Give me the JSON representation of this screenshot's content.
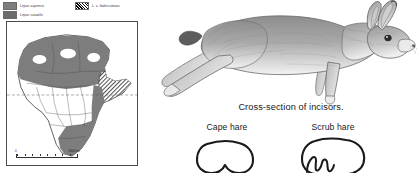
{
  "figure": {
    "kind": "natural-history-plate",
    "background": "#ffffff"
  },
  "map": {
    "region": "Africa",
    "legend": [
      {
        "label": "Lepus capensis",
        "swatch": "solid-gray",
        "color": "#7d7d7d",
        "icon": "legend-swatch-icon"
      },
      {
        "label": "Lepus saxatilis",
        "swatch": "solid-gray",
        "color": "#6b6b6b",
        "icon": "legend-swatch-icon"
      },
      {
        "label": "L. c. habessinicus",
        "swatch": "hatched",
        "color": "#2b2b2b",
        "icon": "legend-swatch-hatched-icon"
      }
    ],
    "scalebar": {
      "zero": "0",
      "length_label": "2000 km"
    },
    "features": {
      "equator_line": true,
      "frame_border": true,
      "gray_range_north": "Sahara / North Africa",
      "gray_range_south": "Southern Africa",
      "hatched_range": "Horn of Africa",
      "white_gaps": "unoccupied desert pockets"
    }
  },
  "illustration": {
    "subject": "running hare",
    "style": "graphite pencil drawing",
    "orientation": "facing right, legs extended"
  },
  "incisors": {
    "title": "Cross-section of incisors.",
    "items": [
      {
        "label": "Cape hare",
        "groove": "simple shallow V-shaped notch"
      },
      {
        "label": "Scrub hare",
        "groove": "complex crenulated zigzag groove"
      }
    ]
  },
  "colors": {
    "range_gray": "#7d7d7d",
    "hatch_dark": "#2b2b2b",
    "outline": "#3a3a3a",
    "text": "#1a1a1a"
  }
}
